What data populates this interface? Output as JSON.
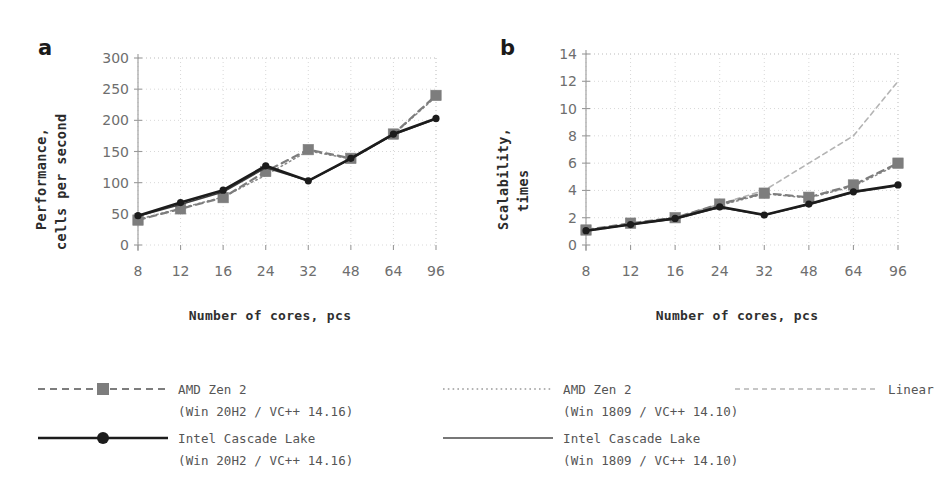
{
  "figure": {
    "panel_a_letter": "a",
    "panel_b_letter": "b"
  },
  "chart_data": [
    {
      "type": "line",
      "panel": "a",
      "title": "",
      "xlabel": "Number of cores, pcs",
      "ylabel": "Performance, cells per second",
      "ylabel_line1": "Performance,",
      "ylabel_line2": "cells per second",
      "categories": [
        "8",
        "12",
        "16",
        "24",
        "32",
        "48",
        "64",
        "96"
      ],
      "xticklabels": [
        "8",
        "12",
        "16",
        "24",
        "32",
        "48",
        "64",
        "96"
      ],
      "yticklabels": [
        "0",
        "50",
        "100",
        "150",
        "200",
        "250",
        "300"
      ],
      "ylim": [
        0,
        300
      ],
      "ytick_step": 50,
      "grid": true,
      "legend_position": "below-figure",
      "series": [
        {
          "name": "AMD Zen 2 (Win 20H2 / VC++ 14.16)",
          "style": "dashed-square",
          "color": "#7d7d7d",
          "values": [
            40,
            58,
            76,
            118,
            153,
            139,
            178,
            240
          ]
        },
        {
          "name": "AMD Zen 2 (Win 1809 / VC++ 14.10)",
          "style": "dotted",
          "color": "#8a8a8a",
          "values": [
            41,
            59,
            77,
            112,
            151,
            138,
            177,
            238
          ]
        },
        {
          "name": "Intel Cascade Lake (Win 20H2 / VC++ 14.16)",
          "style": "solid-circle",
          "color": "#1c1c1c",
          "values": [
            47,
            68,
            88,
            127,
            103,
            139,
            178,
            203
          ]
        },
        {
          "name": "Intel Cascade Lake (Win 1809 / VC++ 14.10)",
          "style": "solid-thin",
          "color": "#3d3d3d",
          "values": [
            46,
            65,
            85,
            124,
            103,
            138,
            177,
            202
          ]
        }
      ]
    },
    {
      "type": "line",
      "panel": "b",
      "title": "",
      "xlabel": "Number of cores, pcs",
      "ylabel": "Scalability, times",
      "ylabel_line1": "Scalability,",
      "ylabel_line2": "times",
      "categories": [
        "8",
        "12",
        "16",
        "24",
        "32",
        "48",
        "64",
        "96"
      ],
      "xticklabels": [
        "8",
        "12",
        "16",
        "24",
        "32",
        "48",
        "64",
        "96"
      ],
      "yticklabels": [
        "0",
        "2",
        "4",
        "6",
        "8",
        "10",
        "12",
        "14"
      ],
      "ylim": [
        0,
        14
      ],
      "ytick_step": 2,
      "grid": true,
      "legend_position": "below-figure",
      "series": [
        {
          "name": "AMD Zen 2 (Win 20H2 / VC++ 14.16)",
          "style": "dashed-square",
          "color": "#7d7d7d",
          "values": [
            1.1,
            1.6,
            2.0,
            3.0,
            3.8,
            3.5,
            4.4,
            6.0
          ]
        },
        {
          "name": "AMD Zen 2 (Win 1809 / VC++ 14.10)",
          "style": "dotted",
          "color": "#8a8a8a",
          "values": [
            1.1,
            1.55,
            2.0,
            2.9,
            3.75,
            3.45,
            4.3,
            5.9
          ]
        },
        {
          "name": "Intel Cascade Lake (Win 20H2 / VC++ 14.16)",
          "style": "solid-circle",
          "color": "#1c1c1c",
          "values": [
            1.05,
            1.5,
            1.95,
            2.8,
            2.2,
            3.0,
            3.9,
            4.4
          ]
        },
        {
          "name": "Intel Cascade Lake (Win 1809 / VC++ 14.10)",
          "style": "solid-thin",
          "color": "#3d3d3d",
          "values": [
            1.05,
            1.5,
            1.9,
            2.75,
            2.2,
            2.95,
            3.85,
            4.35
          ]
        },
        {
          "name": "Linear",
          "style": "dashed-light",
          "color": "#b4b4b4",
          "values": [
            1.0,
            1.5,
            2.0,
            3.0,
            4.0,
            6.0,
            8.0,
            12.0
          ]
        }
      ]
    }
  ],
  "legend": {
    "entries": [
      {
        "id": "amd-zen2-20h2",
        "label_line1": "AMD Zen 2",
        "label_line2": "(Win 20H2 / VC++ 14.16)",
        "style": "dashed-square",
        "color": "#7d7d7d"
      },
      {
        "id": "amd-zen2-1809",
        "label_line1": "AMD Zen 2",
        "label_line2": "(Win 1809 / VC++ 14.10)",
        "style": "dotted",
        "color": "#9a9a9a"
      },
      {
        "id": "linear",
        "label_line1": "Linear",
        "label_line2": "",
        "style": "dashed-light",
        "color": "#b4b4b4"
      },
      {
        "id": "intel-cascade-lake-20h2",
        "label_line1": "Intel Cascade Lake",
        "label_line2": "(Win 20H2 / VC++ 14.16)",
        "style": "solid-circle",
        "color": "#1c1c1c"
      },
      {
        "id": "intel-cascade-lake-1809",
        "label_line1": "Intel Cascade Lake",
        "label_line2": "(Win 1809 / VC++ 14.10)",
        "style": "solid-thin",
        "color": "#4a4a4a"
      }
    ]
  }
}
